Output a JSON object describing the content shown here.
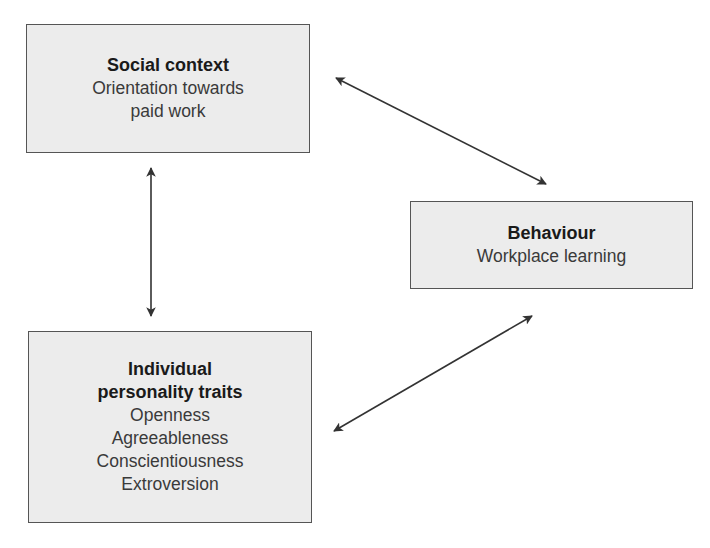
{
  "boxes": {
    "social": {
      "title": "Social context",
      "lines": [
        "Orientation towards",
        "paid work"
      ]
    },
    "behaviour": {
      "title": "Behaviour",
      "lines": [
        "Workplace learning"
      ]
    },
    "individual": {
      "title_lines": [
        "Individual",
        "personality traits"
      ],
      "lines": [
        "Openness",
        "Agreeableness",
        "Conscientiousness",
        "Extroversion"
      ]
    }
  },
  "arrows": [
    {
      "from": "social",
      "to": "behaviour",
      "type": "bidirectional"
    },
    {
      "from": "social",
      "to": "individual",
      "type": "bidirectional"
    },
    {
      "from": "individual",
      "to": "behaviour",
      "type": "bidirectional"
    }
  ],
  "colors": {
    "box_fill": "#ececec",
    "box_border": "#555555",
    "arrow": "#333333"
  }
}
